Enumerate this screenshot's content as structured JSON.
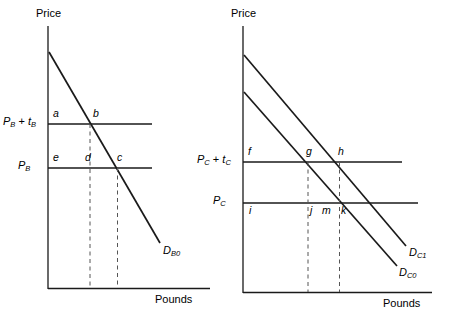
{
  "figure": {
    "type": "economics-diagram",
    "panels": [
      {
        "id": "left",
        "axes": {
          "y_label": "Price",
          "x_label": "Pounds"
        },
        "price_lines": [
          {
            "id": "upper",
            "label_main": "P",
            "label_sub": "B",
            "label_op": " + ",
            "label_tax": "t",
            "label_tax_sub": "B",
            "text": "P_B + t_B"
          },
          {
            "id": "lower",
            "label_main": "P",
            "label_sub": "B",
            "text": "P_B"
          }
        ],
        "curves": [
          {
            "id": "DB0",
            "label_main": "D",
            "label_sub": "B0",
            "text": "D_B0"
          }
        ],
        "points": [
          {
            "id": "a",
            "label": "a"
          },
          {
            "id": "b",
            "label": "b"
          },
          {
            "id": "e",
            "label": "e"
          },
          {
            "id": "d",
            "label": "d"
          },
          {
            "id": "c",
            "label": "c"
          }
        ]
      },
      {
        "id": "right",
        "axes": {
          "y_label": "Price",
          "x_label": "Pounds"
        },
        "price_lines": [
          {
            "id": "upper",
            "label_main": "P",
            "label_sub": "C",
            "label_op": " + ",
            "label_tax": "t",
            "label_tax_sub": "C",
            "text": "P_C + t_C"
          },
          {
            "id": "lower",
            "label_main": "P",
            "label_sub": "C",
            "text": "P_C"
          }
        ],
        "curves": [
          {
            "id": "DC1",
            "label_main": "D",
            "label_sub": "C1",
            "text": "D_C1"
          },
          {
            "id": "DC0",
            "label_main": "D",
            "label_sub": "C0",
            "text": "D_C0"
          }
        ],
        "points": [
          {
            "id": "f",
            "label": "f"
          },
          {
            "id": "g",
            "label": "g"
          },
          {
            "id": "h",
            "label": "h"
          },
          {
            "id": "i",
            "label": "i"
          },
          {
            "id": "j",
            "label": "j"
          },
          {
            "id": "m",
            "label": "m"
          },
          {
            "id": "k",
            "label": "k"
          }
        ]
      }
    ],
    "colors": {
      "line": "#1a1a1a",
      "dashed": "#555555",
      "background": "#ffffff"
    }
  }
}
